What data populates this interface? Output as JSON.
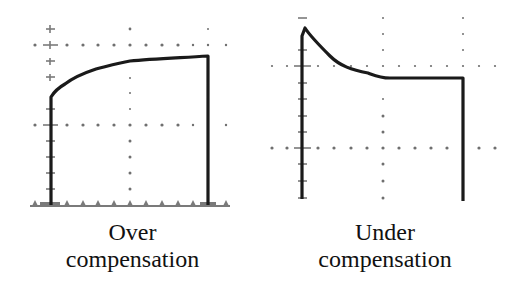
{
  "diagram": {
    "type": "oscilloscope-traces",
    "panels": [
      {
        "id": "over",
        "caption_line1": "Over",
        "caption_line2": "compensation",
        "waveform_shape": "rising-overshoot-free square edge that slowly rises to flat top (rounded leading corner)"
      },
      {
        "id": "under",
        "caption_line1": "Under",
        "caption_line2": "compensation",
        "waveform_shape": "spike at leading edge decaying down to flat top"
      }
    ],
    "colors": {
      "trace": "#1a1a1a",
      "grid": "#7a7a7a",
      "background": "#ffffff",
      "text": "#111111"
    }
  }
}
